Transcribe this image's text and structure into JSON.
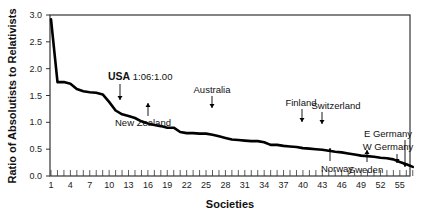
{
  "chart_data": {
    "type": "line",
    "title": "",
    "xlabel": "Societies",
    "ylabel": "Ratio of Absolutists to Relativists",
    "xlim": [
      1,
      57
    ],
    "ylim": [
      0,
      3.0
    ],
    "grid": false,
    "legend": null,
    "x_ticks": [
      1,
      4,
      7,
      10,
      13,
      16,
      19,
      22,
      25,
      28,
      31,
      34,
      37,
      40,
      43,
      46,
      49,
      52,
      55
    ],
    "y_ticks": [
      "0.0",
      "0.5",
      "1.0",
      "1.5",
      "2.0",
      "2.5",
      "3.0"
    ],
    "x": [
      1,
      2,
      3,
      4,
      5,
      6,
      7,
      8,
      9,
      10,
      11,
      12,
      13,
      14,
      15,
      16,
      17,
      18,
      19,
      20,
      21,
      22,
      23,
      24,
      25,
      26,
      27,
      28,
      29,
      30,
      31,
      32,
      33,
      34,
      35,
      36,
      37,
      38,
      39,
      40,
      41,
      42,
      43,
      44,
      45,
      46,
      47,
      48,
      49,
      50,
      51,
      52,
      53,
      54,
      55,
      56,
      57
    ],
    "series": [
      {
        "name": "Ratio",
        "values": [
          2.92,
          1.75,
          1.75,
          1.72,
          1.62,
          1.58,
          1.56,
          1.55,
          1.52,
          1.38,
          1.22,
          1.15,
          1.12,
          1.08,
          1.02,
          0.98,
          0.95,
          0.93,
          0.9,
          0.9,
          0.82,
          0.8,
          0.8,
          0.79,
          0.79,
          0.77,
          0.74,
          0.71,
          0.68,
          0.67,
          0.66,
          0.65,
          0.65,
          0.63,
          0.58,
          0.58,
          0.56,
          0.55,
          0.54,
          0.52,
          0.51,
          0.5,
          0.49,
          0.47,
          0.45,
          0.44,
          0.42,
          0.4,
          0.38,
          0.37,
          0.36,
          0.34,
          0.33,
          0.31,
          0.26,
          0.22,
          0.17
        ]
      }
    ],
    "annotations": [
      {
        "label_bold": "USA",
        "label": " 1:06:1.00",
        "society": 12,
        "arrow": "down"
      },
      {
        "label": "New Zealand",
        "society": 16,
        "arrow": "up"
      },
      {
        "label": "Australia",
        "society": 26,
        "arrow": "down"
      },
      {
        "label": "Finland",
        "society": 40,
        "arrow": "down"
      },
      {
        "label": "Switzerland",
        "society": 43,
        "arrow": "down"
      },
      {
        "label": "Norway",
        "society": 44,
        "arrow": "up"
      },
      {
        "label": "Sweden",
        "society": 50,
        "arrow": "up"
      },
      {
        "label": "W Germany",
        "society": 55,
        "arrow": "down"
      },
      {
        "label": "E Germany",
        "society": 57,
        "arrow": "down"
      }
    ]
  }
}
